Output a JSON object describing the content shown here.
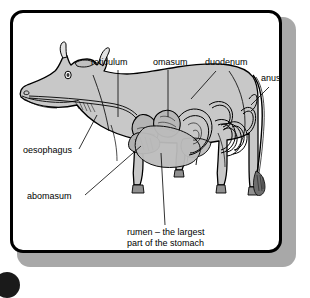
{
  "figure": {
    "frame": {
      "border_color": "#000000",
      "background_color": "#ffffff",
      "shadow_color": "#a8a8a8"
    },
    "body_fill_color": "#c8c8c8",
    "organ_fill_color": "#b4b4b4",
    "line_color": "#000000"
  },
  "labels": {
    "reticulum": "reticulum",
    "omasum": "omasum",
    "duodenum": "duodenum",
    "anus": "anus",
    "oesophagus": "oesophagus",
    "abomasum": "abomasum",
    "rumen_line1": "rumen – the largest",
    "rumen_line2": "part of the stomach"
  },
  "annotations": [
    {
      "id": "reticulum",
      "text": "reticulum",
      "x": 88,
      "y": 62,
      "leader": "vertical"
    },
    {
      "id": "omasum",
      "text": "omasum",
      "x": 150,
      "y": 62,
      "leader": "vertical"
    },
    {
      "id": "duodenum",
      "text": "duodenum",
      "x": 202,
      "y": 62,
      "leader": "diagonal"
    },
    {
      "id": "anus",
      "text": "anus",
      "x": 258,
      "y": 76,
      "leader": "diagonal"
    },
    {
      "id": "oesophagus",
      "text": "oesophagus",
      "x": 22,
      "y": 146,
      "leader": "diagonal"
    },
    {
      "id": "abomasum",
      "text": "abomasum",
      "x": 28,
      "y": 186,
      "leader": "diagonal"
    },
    {
      "id": "rumen",
      "text": "rumen – the largest",
      "x": 125,
      "y": 226,
      "leader": "vertical"
    }
  ]
}
